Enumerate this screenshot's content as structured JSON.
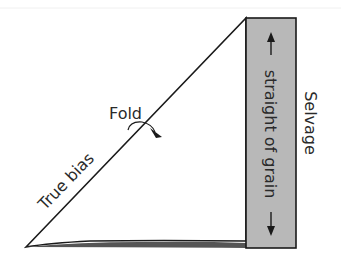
{
  "labels": {
    "fold": "Fold",
    "true_bias": "True bias",
    "straight_of_grain": "straight of grain",
    "selvage": "Selvage"
  },
  "colors": {
    "line": "#1a1a1a",
    "selvage_fill": "#b8b8b8",
    "text": "#2a2a2a"
  },
  "icons": {
    "fold_arrow": "curved-arrow",
    "grain_arrow": "double-headed-arrow"
  }
}
